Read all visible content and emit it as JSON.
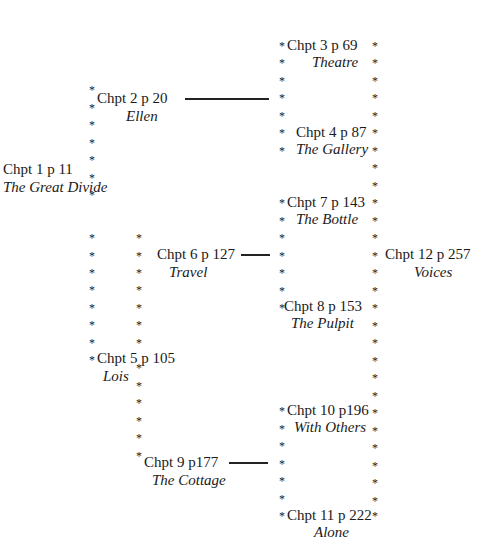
{
  "diagram": {
    "type": "chapter-structure",
    "nodes": [
      {
        "id": "c1",
        "chapter": "Chpt 1 p 11",
        "title": "The Great Divide",
        "x": 3,
        "y": 160,
        "tx": 3,
        "ty": 178
      },
      {
        "id": "c2",
        "chapter": "Chpt 2 p 20",
        "title": "Ellen",
        "x": 97,
        "y": 89,
        "tx": 126,
        "ty": 107
      },
      {
        "id": "c3",
        "chapter": "Chpt 3 p 69",
        "title": "Theatre",
        "x": 287,
        "y": 36,
        "tx": 312,
        "ty": 53
      },
      {
        "id": "c4",
        "chapter": "Chpt 4 p 87",
        "title": "The Gallery",
        "x": 296,
        "y": 123,
        "tx": 296,
        "ty": 140
      },
      {
        "id": "c5",
        "chapter": "Chpt 5 p 105",
        "title": "Lois",
        "x": 97,
        "y": 349,
        "tx": 103,
        "ty": 367
      },
      {
        "id": "c6",
        "chapter": "Chpt 6 p 127",
        "title": "Travel",
        "x": 157,
        "y": 245,
        "tx": 169,
        "ty": 263
      },
      {
        "id": "c7",
        "chapter": "Chpt 7 p 143",
        "title": "The Bottle",
        "x": 287,
        "y": 193,
        "tx": 296,
        "ty": 210
      },
      {
        "id": "c8",
        "chapter": "Chpt 8 p 153",
        "title": "The Pulpit",
        "x": 284,
        "y": 297,
        "tx": 291,
        "ty": 314
      },
      {
        "id": "c9",
        "chapter": "Chpt 9 p177",
        "title": "The Cottage",
        "x": 144,
        "y": 453,
        "tx": 152,
        "ty": 471
      },
      {
        "id": "c10",
        "chapter": "Chpt 10 p196",
        "title": "With Others",
        "x": 287,
        "y": 401,
        "tx": 294,
        "ty": 418
      },
      {
        "id": "c11",
        "chapter": "Chpt 11 p 222",
        "title": "Alone",
        "x": 287,
        "y": 506,
        "tx": 314,
        "ty": 523
      },
      {
        "id": "c12",
        "chapter": "Chpt 12 p 257",
        "title": "Voices",
        "x": 385,
        "y": 245,
        "tx": 414,
        "ty": 263
      }
    ],
    "connectors": [
      {
        "from": "c2",
        "to": "column-c3-c11",
        "x1": 185,
        "x2": 269,
        "y": 98
      },
      {
        "from": "c6",
        "to": "column-c3-c11",
        "x1": 241,
        "x2": 270,
        "y": 254
      },
      {
        "from": "c9",
        "to": "column-c3-c11",
        "x1": 229,
        "x2": 268,
        "y": 462
      }
    ],
    "star_columns": [
      {
        "x": 89,
        "ys": [
          88,
          106,
          123,
          141,
          158,
          176,
          193,
          236,
          254,
          271,
          288,
          306,
          323,
          341,
          358
        ]
      },
      {
        "x": 136,
        "ys": [
          236,
          254,
          271,
          288,
          306,
          323,
          341,
          366,
          384,
          401,
          419,
          436,
          454
        ]
      },
      {
        "x": 279,
        "ys": [
          44,
          61,
          79,
          96,
          114,
          131,
          149,
          201,
          219,
          236,
          254,
          271,
          289,
          306,
          409,
          427,
          444,
          462,
          479,
          497,
          514
        ]
      },
      {
        "x": 372,
        "ys": [
          44,
          61,
          79,
          96,
          114,
          131,
          149,
          166,
          184,
          201,
          219,
          236,
          254,
          271,
          289,
          306,
          324,
          341,
          359,
          376,
          394,
          411,
          429,
          446,
          464,
          481,
          499,
          514
        ]
      }
    ]
  }
}
